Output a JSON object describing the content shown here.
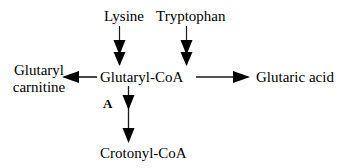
{
  "diagram": {
    "background_color": "#ffffff",
    "text_color": "#000000",
    "arrow_color": "#1a1a1a",
    "nodes": {
      "lysine": "Lysine",
      "tryptophan": "Tryptophan",
      "glutaryl_coa": "Glutaryl-CoA",
      "glutaryl_carnitine_line1": "Glutaryl",
      "glutaryl_carnitine_line2": "carnitine",
      "glutaric_acid": "Glutaric acid",
      "crotonyl_coa": "Crotonyl-CoA"
    },
    "labels": {
      "enzyme_step_a": "A"
    },
    "edges": [
      {
        "from": "Lysine",
        "to": "Glutaryl-CoA",
        "direction": "down"
      },
      {
        "from": "Tryptophan",
        "to": "Glutaryl-CoA",
        "direction": "down"
      },
      {
        "from": "Glutaryl-CoA",
        "to": "Glutaryl carnitine",
        "direction": "left"
      },
      {
        "from": "Glutaryl-CoA",
        "to": "Glutaric acid",
        "direction": "right"
      },
      {
        "from": "Glutaryl-CoA",
        "to": "Crotonyl-CoA",
        "direction": "down",
        "label": "A"
      }
    ]
  }
}
